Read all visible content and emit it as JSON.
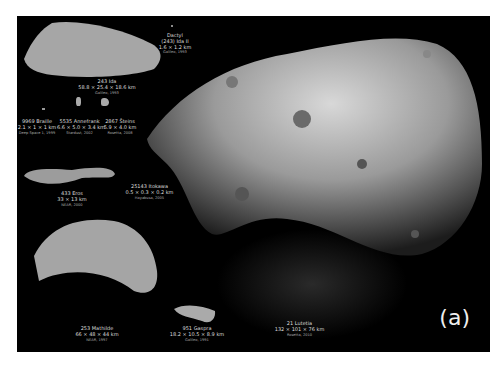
{
  "figure": {
    "panel_tag": "(a)",
    "background": "#000000",
    "border_color": "#ffffff"
  },
  "asteroids": [
    {
      "id": "ida",
      "name": "243 Ida",
      "dims": "58.8 × 25.4 × 18.6 km",
      "credit": "Galileo, 1993"
    },
    {
      "id": "dactyl",
      "name": "Dactyl",
      "subname": "(243) Ida II",
      "dims": "1.6 × 1.2 km",
      "credit": "Galileo, 1993"
    },
    {
      "id": "braille",
      "name": "9969 Braille",
      "dims": "2.1 × 1 × 1 km",
      "credit": "Deep Space 1, 1999"
    },
    {
      "id": "annefrank",
      "name": "5535 Annefrank",
      "dims": "6.6 × 5.0 × 3.4 km",
      "credit": "Stardust, 2002"
    },
    {
      "id": "steins",
      "name": "2867 Šteins",
      "dims": "5.9 × 4.0 km",
      "credit": "Rosetta, 2008"
    },
    {
      "id": "eros",
      "name": "433 Eros",
      "dims": "33 × 13 km",
      "credit": "NEAR, 2000"
    },
    {
      "id": "itokawa",
      "name": "25143 Itokawa",
      "dims": "0.5 × 0.3 × 0.2 km",
      "credit": "Hayabusa, 2005"
    },
    {
      "id": "mathilde",
      "name": "253 Mathilde",
      "dims": "66 × 48 × 44 km",
      "credit": "NEAR, 1997"
    },
    {
      "id": "gaspra",
      "name": "951 Gaspra",
      "dims": "18.2 × 10.5 × 8.9 km",
      "credit": "Galileo, 1991"
    },
    {
      "id": "lutetia",
      "name": "21 Lutetia",
      "dims": "132 × 101 × 76 km",
      "credit": "Rosetta, 2010"
    }
  ]
}
